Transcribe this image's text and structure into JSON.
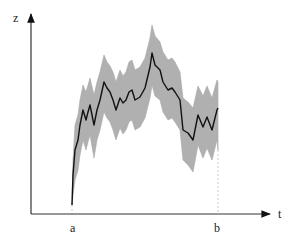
{
  "chart_data": {
    "type": "area",
    "title": "",
    "xlabel": "t",
    "ylabel": "z",
    "x_ticks": [
      {
        "label": "a",
        "x": 73
      },
      {
        "label": "b",
        "x": 218
      }
    ],
    "grid": false,
    "legend": null,
    "series": [
      {
        "name": "mean path",
        "style": "line",
        "color": "#111111",
        "points": [
          [
            72,
            205
          ],
          [
            73,
            175
          ],
          [
            75,
            150
          ],
          [
            78,
            140
          ],
          [
            80,
            125
          ],
          [
            83,
            110
          ],
          [
            86,
            120
          ],
          [
            88,
            112
          ],
          [
            90,
            105
          ],
          [
            94,
            125
          ],
          [
            97,
            110
          ],
          [
            100,
            100
          ],
          [
            104,
            82
          ],
          [
            107,
            88
          ],
          [
            110,
            92
          ],
          [
            113,
            100
          ],
          [
            116,
            110
          ],
          [
            120,
            98
          ],
          [
            123,
            103
          ],
          [
            126,
            100
          ],
          [
            129,
            92
          ],
          [
            132,
            90
          ],
          [
            135,
            100
          ],
          [
            140,
            97
          ],
          [
            145,
            88
          ],
          [
            150,
            67
          ],
          [
            152,
            53
          ],
          [
            155,
            65
          ],
          [
            160,
            70
          ],
          [
            163,
            82
          ],
          [
            168,
            90
          ],
          [
            172,
            88
          ],
          [
            175,
            92
          ],
          [
            180,
            100
          ],
          [
            183,
            130
          ],
          [
            188,
            133
          ],
          [
            193,
            140
          ],
          [
            198,
            115
          ],
          [
            203,
            127
          ],
          [
            207,
            117
          ],
          [
            212,
            130
          ],
          [
            217,
            110
          ],
          [
            218,
            108
          ]
        ]
      },
      {
        "name": "confidence band",
        "style": "band",
        "color": "#b0b0b0",
        "upper": [
          [
            72,
            205
          ],
          [
            73,
            160
          ],
          [
            75,
            125
          ],
          [
            78,
            115
          ],
          [
            80,
            100
          ],
          [
            83,
            85
          ],
          [
            86,
            92
          ],
          [
            88,
            85
          ],
          [
            90,
            78
          ],
          [
            94,
            95
          ],
          [
            97,
            82
          ],
          [
            100,
            72
          ],
          [
            104,
            55
          ],
          [
            107,
            62
          ],
          [
            110,
            66
          ],
          [
            113,
            72
          ],
          [
            116,
            82
          ],
          [
            120,
            70
          ],
          [
            123,
            76
          ],
          [
            126,
            72
          ],
          [
            129,
            62
          ],
          [
            132,
            60
          ],
          [
            135,
            70
          ],
          [
            140,
            67
          ],
          [
            145,
            58
          ],
          [
            150,
            38
          ],
          [
            152,
            25
          ],
          [
            155,
            36
          ],
          [
            160,
            42
          ],
          [
            163,
            52
          ],
          [
            168,
            60
          ],
          [
            172,
            58
          ],
          [
            175,
            62
          ],
          [
            180,
            72
          ],
          [
            183,
            98
          ],
          [
            188,
            102
          ],
          [
            193,
            108
          ],
          [
            198,
            86
          ],
          [
            203,
            96
          ],
          [
            207,
            86
          ],
          [
            212,
            98
          ],
          [
            217,
            80
          ],
          [
            218,
            82
          ]
        ],
        "lower": [
          [
            72,
            205
          ],
          [
            73,
            195
          ],
          [
            75,
            180
          ],
          [
            78,
            170
          ],
          [
            80,
            155
          ],
          [
            83,
            140
          ],
          [
            86,
            150
          ],
          [
            88,
            142
          ],
          [
            90,
            135
          ],
          [
            94,
            158
          ],
          [
            97,
            140
          ],
          [
            100,
            130
          ],
          [
            104,
            112
          ],
          [
            107,
            118
          ],
          [
            110,
            122
          ],
          [
            113,
            130
          ],
          [
            116,
            140
          ],
          [
            120,
            128
          ],
          [
            123,
            134
          ],
          [
            126,
            130
          ],
          [
            129,
            122
          ],
          [
            132,
            120
          ],
          [
            135,
            130
          ],
          [
            140,
            127
          ],
          [
            145,
            118
          ],
          [
            150,
            98
          ],
          [
            152,
            85
          ],
          [
            155,
            96
          ],
          [
            160,
            100
          ],
          [
            163,
            112
          ],
          [
            168,
            120
          ],
          [
            172,
            118
          ],
          [
            175,
            122
          ],
          [
            180,
            130
          ],
          [
            183,
            160
          ],
          [
            188,
            165
          ],
          [
            193,
            172
          ],
          [
            198,
            145
          ],
          [
            203,
            158
          ],
          [
            207,
            148
          ],
          [
            212,
            160
          ],
          [
            217,
            140
          ],
          [
            218,
            150
          ]
        ]
      }
    ],
    "axes": {
      "origin": [
        31,
        214
      ],
      "x_end": [
        270,
        214
      ],
      "y_end": [
        31,
        14
      ]
    },
    "guides": [
      {
        "x": 72,
        "y_from": 205,
        "y_to": 214
      },
      {
        "x": 218,
        "y_from": 150,
        "y_to": 214
      }
    ]
  },
  "labels": {
    "y_axis": "z",
    "x_axis": "t",
    "tick_a": "a",
    "tick_b": "b"
  }
}
